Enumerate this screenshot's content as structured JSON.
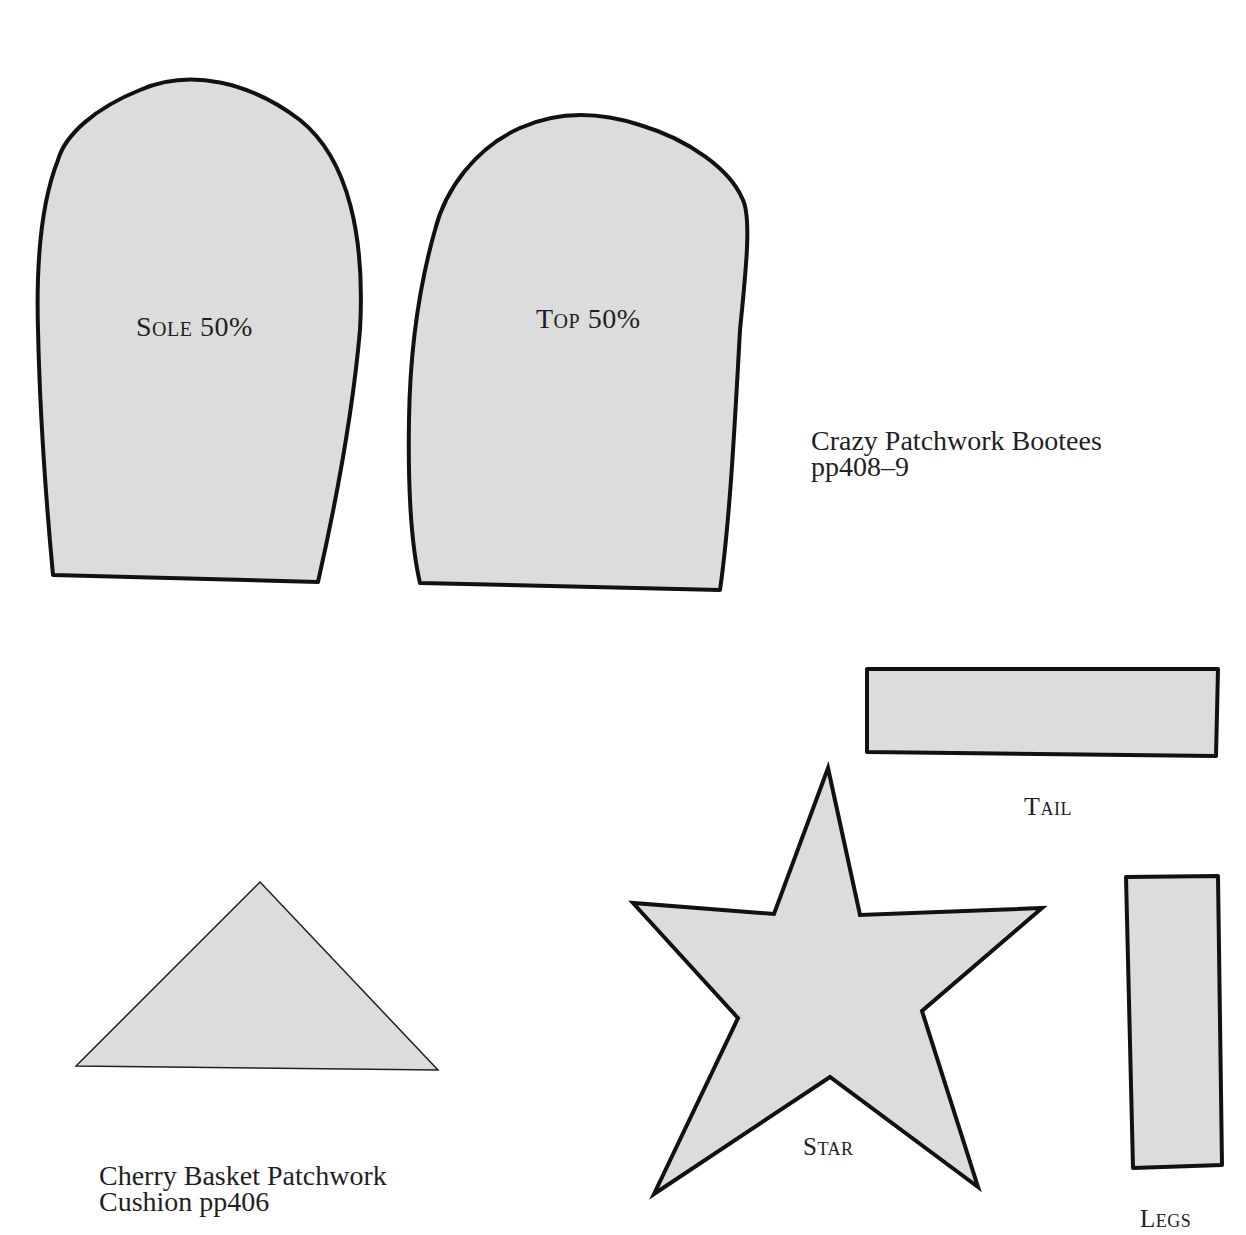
{
  "colors": {
    "background": "#ffffff",
    "piece_fill": "#dcdcdc",
    "outline": "#111111",
    "text": "#1f1f1f"
  },
  "bootees": {
    "caption_line1": "Crazy Patchwork Bootees",
    "caption_line2": "pp408–9",
    "pieces": [
      {
        "id": "sole",
        "label": "Sole 50%",
        "path": "M53,575 L318,582 C332,520 352,420 360,330 C365,240 350,160 300,120 C250,82 190,68 140,90 C95,108 65,135 58,160 C42,200 36,260 38,330 C40,420 46,500 53,575 Z"
      },
      {
        "id": "top",
        "label": "Top 50%",
        "path": "M420,583 L720,590 C730,520 735,420 740,330 C746,270 752,215 742,198 C730,170 690,140 640,125 C600,112 560,110 520,128 C475,148 445,190 435,230 C418,290 410,350 409,420 C408,480 410,540 420,583 Z"
      }
    ]
  },
  "cushion": {
    "caption_line1": "Cherry Basket Patchwork",
    "caption_line2": "Cushion pp406",
    "triangle_points": "260,882 438,1070 76,1066"
  },
  "toy_pieces": [
    {
      "id": "tail",
      "label": "Tail",
      "points": "867,669 1218,669 1216,756 867,752"
    },
    {
      "id": "star",
      "label": "Star",
      "points": "828,768 860,915 1042,908 922,1011 978,1187 830,1077 654,1194 738,1018 633,903 774,914"
    },
    {
      "id": "legs",
      "label": "Legs",
      "points": "1126,877 1218,876 1222,1165 1133,1168"
    }
  ]
}
